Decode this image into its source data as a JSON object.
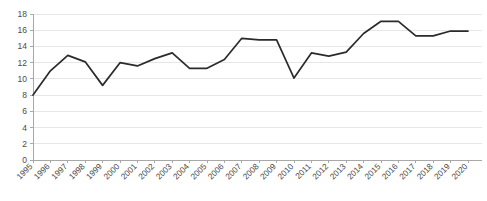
{
  "chart_data": {
    "type": "line",
    "title": "",
    "subtitle": "",
    "xlabel": "",
    "ylabel": "",
    "categories": [
      "1995",
      "1996",
      "1997",
      "1998",
      "1999",
      "2000",
      "2001",
      "2002",
      "2003",
      "2004",
      "2005",
      "2006",
      "2007",
      "2008",
      "2009",
      "2010",
      "2011",
      "2012",
      "2013",
      "2014",
      "2015",
      "2016",
      "2017",
      "2018",
      "2019",
      "2020"
    ],
    "x": [
      1995,
      1996,
      1997,
      1998,
      1999,
      2000,
      2001,
      2002,
      2003,
      2004,
      2005,
      2006,
      2007,
      2008,
      2009,
      2010,
      2011,
      2012,
      2013,
      2014,
      2015,
      2016,
      2017,
      2018,
      2019,
      2020
    ],
    "series": [
      {
        "name": "value",
        "color": "#2b2b2b",
        "values": [
          8,
          11,
          12.9,
          12.1,
          9.2,
          12,
          11.6,
          12.5,
          13.2,
          11.3,
          11.3,
          12.4,
          15,
          14.8,
          14.8,
          10.1,
          13.2,
          12.8,
          13.3,
          15.6,
          17.1,
          17.1,
          15.3,
          15.3,
          15.9,
          15.9
        ]
      }
    ],
    "ylim": [
      0,
      18
    ],
    "yticks": [
      0,
      2,
      4,
      6,
      8,
      10,
      12,
      14,
      16,
      18
    ],
    "ytick_labels": [
      "0",
      "2",
      "4",
      "6",
      "8",
      "10",
      "12",
      "14",
      "16",
      "18"
    ],
    "grid": true,
    "grid_color": "#e6e6e6",
    "legend": false,
    "legend_position": "none",
    "xtick_rotation": -45,
    "axis_color": "#a8a8a8"
  }
}
